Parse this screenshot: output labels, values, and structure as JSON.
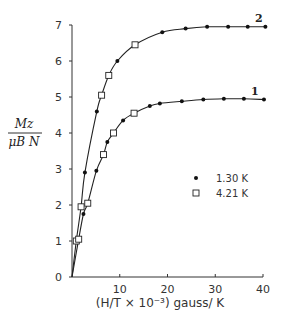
{
  "chart_data": {
    "type": "scatter",
    "title": "",
    "xlabel": "(H/T × 10⁻³) gauss/ K",
    "ylabel_numerator": "Mz",
    "ylabel_denominator": "μB N",
    "xlim": [
      0,
      40
    ],
    "ylim": [
      0,
      7
    ],
    "xticks": [
      10,
      20,
      30,
      40
    ],
    "xtick_labels": [
      "10",
      "20",
      "30",
      "40"
    ],
    "yticks": [
      0,
      1,
      2,
      3,
      4,
      5,
      6,
      7
    ],
    "ytick_labels": [
      "0",
      "1",
      "2",
      "3",
      "4",
      "5",
      "6",
      "7"
    ],
    "grid": false,
    "legend_position": "center-right",
    "legend": [
      {
        "marker": "filled-circle",
        "label": "1.30 K"
      },
      {
        "marker": "open-square",
        "label": "4.21 K"
      }
    ],
    "curves": [
      {
        "name": "2",
        "label": "2",
        "saturation": 6.95,
        "points": [
          {
            "x": 0.9,
            "y": 1.0,
            "marker": "open-square"
          },
          {
            "x": 1.9,
            "y": 1.95,
            "marker": "open-square"
          },
          {
            "x": 2.7,
            "y": 2.9,
            "marker": "filled-circle"
          },
          {
            "x": 5.2,
            "y": 4.6,
            "marker": "filled-circle"
          },
          {
            "x": 6.2,
            "y": 5.05,
            "marker": "open-square"
          },
          {
            "x": 7.7,
            "y": 5.6,
            "marker": "open-square"
          },
          {
            "x": 9.5,
            "y": 6.0,
            "marker": "filled-circle"
          },
          {
            "x": 13.2,
            "y": 6.45,
            "marker": "open-square"
          },
          {
            "x": 18.9,
            "y": 6.8,
            "marker": "filled-circle"
          },
          {
            "x": 23.8,
            "y": 6.9,
            "marker": "filled-circle"
          },
          {
            "x": 28.3,
            "y": 6.95,
            "marker": "filled-circle"
          },
          {
            "x": 32.7,
            "y": 6.95,
            "marker": "filled-circle"
          },
          {
            "x": 36.8,
            "y": 6.95,
            "marker": "filled-circle"
          },
          {
            "x": 40.5,
            "y": 6.95,
            "marker": "filled-circle"
          }
        ]
      },
      {
        "name": "1",
        "label": "1",
        "saturation": 4.95,
        "points": [
          {
            "x": 1.4,
            "y": 1.05,
            "marker": "open-square"
          },
          {
            "x": 2.4,
            "y": 1.75,
            "marker": "filled-circle"
          },
          {
            "x": 3.3,
            "y": 2.05,
            "marker": "open-square"
          },
          {
            "x": 5.1,
            "y": 2.95,
            "marker": "filled-circle"
          },
          {
            "x": 6.6,
            "y": 3.4,
            "marker": "open-square"
          },
          {
            "x": 7.4,
            "y": 3.75,
            "marker": "filled-circle"
          },
          {
            "x": 8.7,
            "y": 4.0,
            "marker": "open-square"
          },
          {
            "x": 10.7,
            "y": 4.35,
            "marker": "filled-circle"
          },
          {
            "x": 13.0,
            "y": 4.55,
            "marker": "open-square"
          },
          {
            "x": 16.3,
            "y": 4.75,
            "marker": "filled-circle"
          },
          {
            "x": 18.4,
            "y": 4.82,
            "marker": "filled-circle"
          },
          {
            "x": 23.0,
            "y": 4.88,
            "marker": "filled-circle"
          },
          {
            "x": 27.5,
            "y": 4.93,
            "marker": "filled-circle"
          },
          {
            "x": 31.8,
            "y": 4.95,
            "marker": "filled-circle"
          },
          {
            "x": 36.0,
            "y": 4.95,
            "marker": "filled-circle"
          },
          {
            "x": 40.2,
            "y": 4.93,
            "marker": "filled-circle"
          }
        ]
      }
    ]
  }
}
